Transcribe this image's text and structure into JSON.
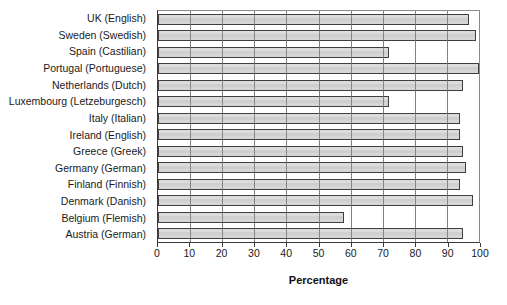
{
  "chart_data": {
    "type": "bar",
    "orientation": "horizontal",
    "title": "",
    "xlabel": "Percentage",
    "ylabel": "",
    "xlim": [
      0,
      100
    ],
    "xticks": [
      0,
      10,
      20,
      30,
      40,
      50,
      60,
      70,
      80,
      90,
      100
    ],
    "grid": true,
    "legend": false,
    "bar_fill_color": "#d2d2d2",
    "bar_edge_color": "#3f3f3f",
    "categories": [
      "UK (English)",
      "Sweden (Swedish)",
      "Spain (Castilian)",
      "Portugal (Portuguese)",
      "Netherlands (Dutch)",
      "Luxembourg (Letzeburgesch)",
      "Italy (Italian)",
      "Ireland (English)",
      "Greece (Greek)",
      "Germany (German)",
      "Finland (Finnish)",
      "Denmark (Danish)",
      "Belgium (Flemish)",
      "Austria (German)"
    ],
    "values": [
      97,
      99,
      72,
      100,
      95,
      72,
      94,
      94,
      95,
      96,
      94,
      98,
      58,
      95
    ]
  }
}
